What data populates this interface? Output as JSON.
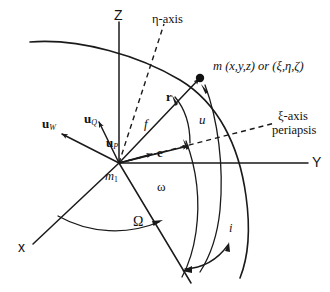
{
  "figure": {
    "background_color": "#ffffff",
    "stroke_color": "#1a1a1a",
    "width": 330,
    "height": 292
  },
  "axes": {
    "z": {
      "label": "Z",
      "desc": "vertical reference axis"
    },
    "y": {
      "label": "Y",
      "desc": "horizontal reference axis to the right"
    },
    "x": {
      "label": "x",
      "desc": "axis toward lower-left, out of page"
    },
    "eta": {
      "label": "η-axis",
      "desc": "dashed perifocal eta axis"
    },
    "xi": {
      "label": "ξ-axis",
      "sub_label": "periapsis",
      "desc": "dashed perifocal xi axis toward periapsis"
    }
  },
  "bodies": {
    "orbiting": {
      "label": "m",
      "coords_cartesian": "(x,y,z)",
      "conjunction": "or",
      "coords_perifocal": "(ξ,η,ζ)",
      "full_label": "m (x,y,z) or (ξ,η,ζ)"
    },
    "central": {
      "label": "m",
      "subscript": "1",
      "full_label": "m₁"
    }
  },
  "vectors": {
    "u_w": {
      "symbol": "u",
      "subscript": "W",
      "full_label": "u_W",
      "desc": "unit vector normal to orbit plane"
    },
    "u_q": {
      "symbol": "u",
      "subscript": "Q",
      "full_label": "u_Q",
      "desc": "perifocal unit vector along eta axis"
    },
    "u_p": {
      "symbol": "u",
      "subscript": "P",
      "full_label": "u_P",
      "desc": "perifocal unit vector toward periapsis"
    },
    "e": {
      "symbol": "e",
      "full_label": "e",
      "desc": "eccentricity vector toward periapsis"
    },
    "r": {
      "symbol": "r",
      "full_label": "r",
      "desc": "position vector from m1 to m"
    }
  },
  "angles": {
    "true_anomaly": {
      "label": "f",
      "desc": "true anomaly measured from periapsis to r"
    },
    "argument_of_latitude": {
      "label": "u",
      "desc": "argument of latitude from ascending node to r"
    },
    "argument_of_periapsis": {
      "label": "ω",
      "desc": "argument of periapsis from ascending node to periapsis"
    },
    "raan": {
      "label": "Ω",
      "desc": "right ascension of ascending node measured in reference plane"
    },
    "inclination": {
      "label": "i",
      "desc": "inclination between reference plane and orbit plane"
    }
  },
  "curves": {
    "orbit": "orbital path arc passing through m",
    "node_line": "line of nodes through ascending node",
    "arc_f": "arc spanning true anomaly f",
    "arc_u": "arc spanning argument of latitude u",
    "arc_omega": "arc spanning argument of periapsis omega",
    "arc_raan": "arc spanning right ascension of ascending node Omega",
    "arc_incl": "small arc spanning inclination i"
  }
}
